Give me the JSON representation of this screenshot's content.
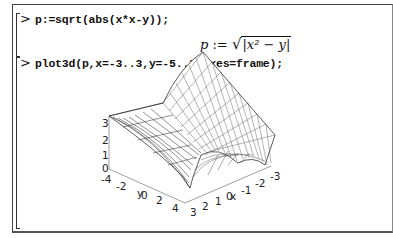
{
  "worksheet": {
    "inputs": [
      {
        "prompt": ">",
        "command": "p:=sqrt(abs(x*x-y));"
      },
      {
        "prompt": ">",
        "command": "plot3d(p,x=-3..3,y=-5..5,axes=frame);"
      }
    ],
    "outputs": [
      {
        "lhs": "p",
        "assign": ":=",
        "radical": "√",
        "abs_expr": "|x² − y|"
      }
    ]
  },
  "plot": {
    "z_ticks": [
      "3",
      "2",
      "1",
      "0"
    ],
    "y_ticks": [
      "-4",
      "-2",
      "y",
      "0",
      "2",
      "4"
    ],
    "x_ticks": [
      "3",
      "2",
      "1",
      "x",
      "0",
      "-1",
      "-2",
      "-3"
    ],
    "y_axis_label": "y",
    "x_axis_label": "x",
    "surface": "sqrt(abs(x^2 - y))",
    "x_range": "-3..3",
    "y_range": "-5..5",
    "axes": "frame"
  }
}
